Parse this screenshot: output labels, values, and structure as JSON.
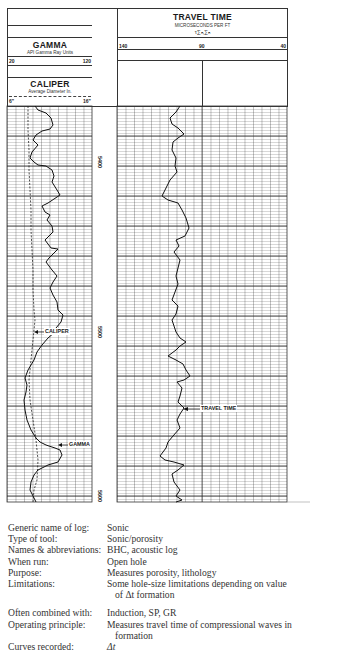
{
  "header": {
    "left_track": {
      "gamma": {
        "title": "GAMMA",
        "units": "API Gamma Ray Units",
        "scale_min": "20",
        "scale_max": "120"
      },
      "caliper": {
        "title": "CALIPER",
        "units": "Average Diameter In.",
        "scale_min": "6\"",
        "scale_max": "16\""
      }
    },
    "right_track": {
      "travel_time": {
        "title": "TRAVEL TIME",
        "units": "MICROSECONDS PER FT",
        "formula": "τ∑ₙ,∑ₙ",
        "scale_left": "140",
        "scale_mid": "90",
        "scale_right": "40"
      }
    }
  },
  "depths": [
    "5400",
    "5500",
    "5600"
  ],
  "curve_labels": {
    "caliper": "CALIPER",
    "gamma": "GAMMA",
    "travel_time": "TRAVEL TIME"
  },
  "footer": {
    "rows": [
      {
        "label": "Generic name of log:",
        "value": "Sonic"
      },
      {
        "label": "Type of tool:",
        "value": "Sonic/porosity"
      },
      {
        "label": "Names & abbreviations:",
        "value": "BHC, acoustic log"
      },
      {
        "label": "When run:",
        "value": "Open hole"
      },
      {
        "label": "Purpose:",
        "value": "Measures porosity, lithology"
      },
      {
        "label": "Limitations:",
        "value": "Some hole-size limitations depending on value",
        "value_cont": "of Δt formation"
      },
      {
        "label": "Often combined with:",
        "value": "Induction, SP, GR"
      },
      {
        "label": "Operating principle:",
        "value": "Measures travel time of compressional waves in",
        "value_cont": "formation"
      },
      {
        "label": "Curves recorded:",
        "value": "Δt"
      }
    ]
  }
}
